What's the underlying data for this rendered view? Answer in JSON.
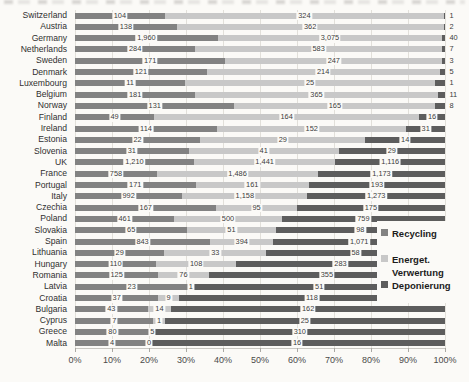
{
  "chart_data": {
    "type": "bar",
    "subtype": "stacked-horizontal-100pct",
    "title": "",
    "xlabel": "",
    "ylabel": "",
    "axis_range_pct": [
      0,
      100
    ],
    "x_tick_labels": [
      "0%",
      "10%",
      "20%",
      "30%",
      "40%",
      "50%",
      "60%",
      "70%",
      "80%",
      "90%",
      "100%"
    ],
    "grid": true,
    "legend_position": "right-overlay",
    "series_names": [
      "Recycling",
      "Energet. Verwertung",
      "Deponierung"
    ],
    "colors": {
      "recycling": "#828282",
      "energet": "#c8c8c8",
      "deponierung": "#5d5d5d"
    },
    "categories": [
      "Switzerland",
      "Austria",
      "Germany",
      "Netherlands",
      "Sweden",
      "Denmark",
      "Luxembourg",
      "Belgium",
      "Norway",
      "Finland",
      "Ireland",
      "Estonia",
      "Slovenia",
      "UK",
      "France",
      "Portugal",
      "Italy",
      "Czechia",
      "Poland",
      "Slovakia",
      "Spain",
      "Lithuania",
      "Hungary",
      "Romania",
      "Latvia",
      "Croatia",
      "Bulgaria",
      "Cyprus",
      "Greece",
      "Malta"
    ],
    "series": [
      {
        "name": "Recycling",
        "values": [
          104,
          138,
          1960,
          284,
          171,
          121,
          11,
          181,
          131,
          49,
          114,
          22,
          31,
          1210,
          758,
          171,
          992,
          167,
          461,
          65,
          843,
          29,
          110,
          125,
          23,
          37,
          43,
          7,
          80,
          4
        ]
      },
      {
        "name": "Energet. Verwertung",
        "values": [
          324,
          362,
          3075,
          583,
          247,
          214,
          25,
          365,
          165,
          164,
          152,
          29,
          41,
          1441,
          1486,
          161,
          1158,
          95,
          500,
          51,
          394,
          33,
          108,
          76,
          1,
          9,
          14,
          1,
          5,
          0
        ]
      },
      {
        "name": "Deponierung",
        "values": [
          1,
          2,
          40,
          7,
          3,
          5,
          1,
          11,
          8,
          16,
          31,
          14,
          29,
          1116,
          1173,
          193,
          1273,
          175,
          759,
          98,
          1071,
          58,
          283,
          355,
          51,
          118,
          162,
          25,
          310,
          16
        ]
      }
    ],
    "legend": {
      "entries": [
        {
          "label": "Recycling",
          "color": "#828282"
        },
        {
          "label": "Energet.",
          "label_line2": "Verwertung",
          "color": "#c8c8c8"
        },
        {
          "label": "Deponierung",
          "color": "#5d5d5d"
        }
      ]
    }
  }
}
